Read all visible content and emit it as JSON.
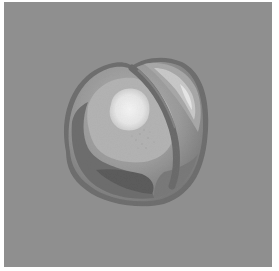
{
  "image": {
    "subject": "peach",
    "style": "grayscale photograph",
    "colors": {
      "border": "#ffffff",
      "background": "#8f8f8f",
      "fruit_rim": "#6f6f6f",
      "fruit_mid": "#9c9c9c",
      "fruit_light": "#b8b8b8",
      "fruit_dark": "#6a6a6a",
      "fruit_darkest": "#5a5a5a",
      "highlight": "#f2f2f2"
    }
  }
}
